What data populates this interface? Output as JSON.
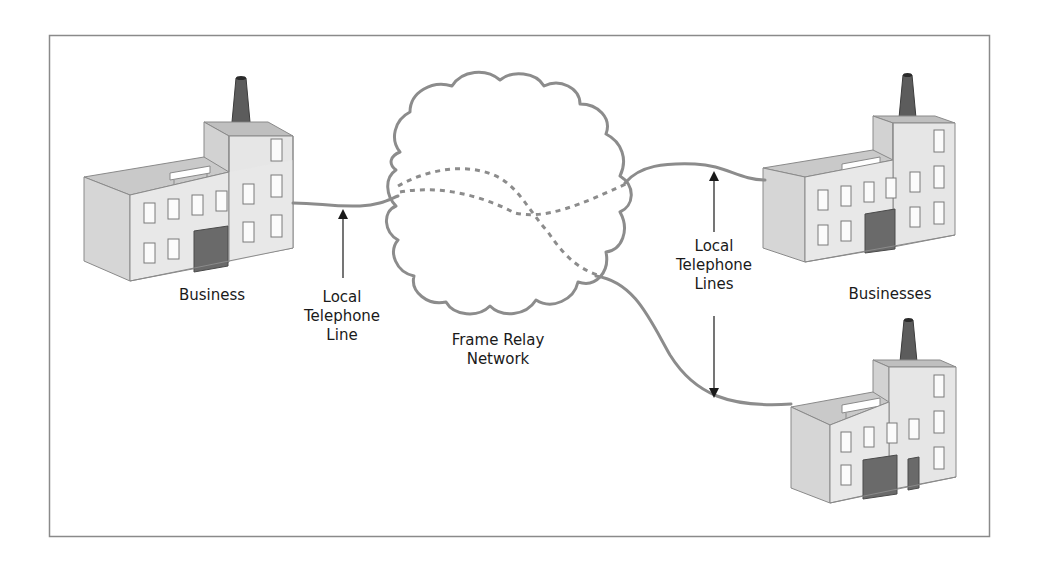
{
  "diagram": {
    "colors": {
      "frame": "#8a8a8a",
      "line": "#8c8c8c",
      "building_light": "#e4e4e4",
      "building_side": "#d4d4d4",
      "roof": "#c8c8c8",
      "chimney": "#5a5a5a",
      "door": "#6a6a6a",
      "window": "#ffffff",
      "text": "#1a1a1a"
    },
    "nodes": [
      {
        "id": "business-left",
        "label": "Business"
      },
      {
        "id": "frame-relay-cloud",
        "label_lines": [
          "Frame Relay",
          "Network"
        ]
      },
      {
        "id": "business-right-top",
        "label": "Businesses"
      },
      {
        "id": "business-right-bottom",
        "label": ""
      }
    ],
    "annotations": {
      "left_line": {
        "lines": [
          "Local",
          "Telephone",
          "Line"
        ]
      },
      "right_lines": {
        "lines": [
          "Local",
          "Telephone",
          "Lines"
        ]
      }
    },
    "labels": {
      "business": "Business",
      "businesses": "Businesses",
      "cloud_line1": "Frame Relay",
      "cloud_line2": "Network",
      "left_l1": "Local",
      "left_l2": "Telephone",
      "left_l3": "Line",
      "right_l1": "Local",
      "right_l2": "Telephone",
      "right_l3": "Lines"
    }
  }
}
